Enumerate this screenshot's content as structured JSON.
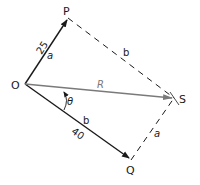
{
  "diagram": {
    "type": "vector-parallelogram",
    "points": {
      "O": {
        "label": "O",
        "x": 25,
        "y": 84
      },
      "P": {
        "label": "P",
        "x": 68,
        "y": 18
      },
      "S": {
        "label": "S",
        "x": 174,
        "y": 98
      },
      "Q": {
        "label": "Q",
        "x": 131,
        "y": 160
      }
    },
    "edges": {
      "OP": {
        "magnitude": "25",
        "side": "a",
        "style": "solid-arrow"
      },
      "OQ": {
        "magnitude": "40",
        "side": "b",
        "style": "solid-arrow"
      },
      "OS": {
        "name": "R",
        "style": "gray-arrow"
      },
      "PS": {
        "side": "b",
        "style": "dashed"
      },
      "QS": {
        "side": "a",
        "style": "dashed"
      }
    },
    "angle": {
      "symbol": "θ",
      "between": "OS-OQ"
    },
    "colors": {
      "line": "#1a1a1a",
      "resultant": "#7a7a7a"
    }
  }
}
